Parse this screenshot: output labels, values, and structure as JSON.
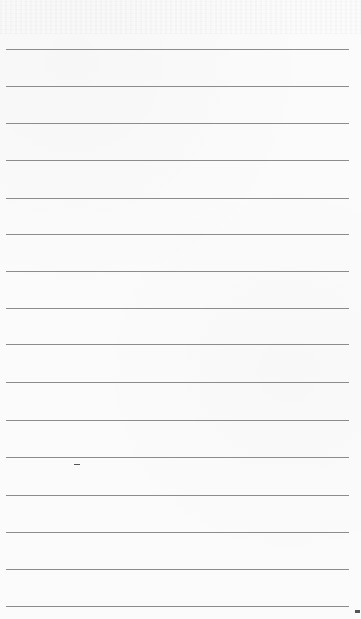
{
  "page": {
    "type": "lined-paper",
    "background_color": "#fbfbfb",
    "rule_color": "#8c8c8c",
    "rule_count": 16,
    "rule_left": 6,
    "rule_width": 343,
    "rules_y": [
      49,
      86,
      123,
      160,
      198,
      234,
      271,
      308,
      344,
      382,
      420,
      457,
      495,
      532,
      569,
      606
    ],
    "top_bleed_through_text": "",
    "marks": [
      {
        "name": "stray-dash",
        "x": 74,
        "y": 464,
        "w": 6,
        "h": 1
      },
      {
        "name": "corner-mark",
        "x": 355,
        "y": 610,
        "w": 5,
        "h": 3
      }
    ]
  }
}
